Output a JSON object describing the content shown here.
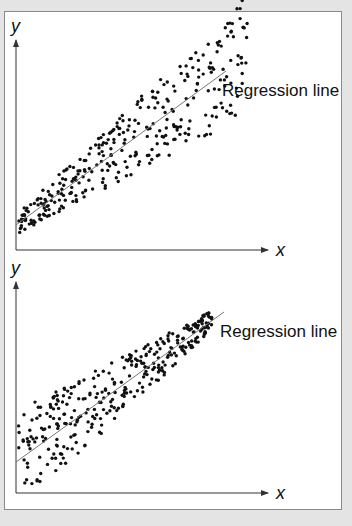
{
  "colors": {
    "background": "#e4e4e4",
    "panel": "#ffffff",
    "dot": "#111111",
    "axis": "#333333",
    "regression": "#777777"
  },
  "chart_data": [
    {
      "type": "scatter",
      "title": "",
      "xlabel": "x",
      "ylabel": "y",
      "annotation": "Regression line",
      "pattern": "fan-out (variance increases with x)",
      "grid": false,
      "axis": {
        "origin": [
          16,
          250
        ],
        "x_end": 268,
        "y_end": 40
      },
      "regression": {
        "x1": 16,
        "y1": 225,
        "x2": 226,
        "y2": 71
      },
      "label_pos": [
        222,
        96
      ],
      "spread": {
        "start_x": 18,
        "end_x": 248,
        "half_width_start": 10,
        "half_width_end": 60
      },
      "n_points": 330,
      "seed": 7
    },
    {
      "type": "scatter",
      "title": "",
      "xlabel": "x",
      "ylabel": "y",
      "annotation": "Regression line",
      "pattern": "fan-in (variance decreases with x)",
      "grid": false,
      "axis": {
        "origin": [
          16,
          493
        ],
        "x_end": 268,
        "y_end": 282
      },
      "regression": {
        "x1": 16,
        "y1": 462,
        "x2": 224,
        "y2": 312
      },
      "label_pos": [
        220,
        337
      ],
      "spread": {
        "start_x": 18,
        "end_x": 212,
        "half_width_start": 50,
        "half_width_end": 10
      },
      "n_points": 330,
      "seed": 13
    }
  ]
}
